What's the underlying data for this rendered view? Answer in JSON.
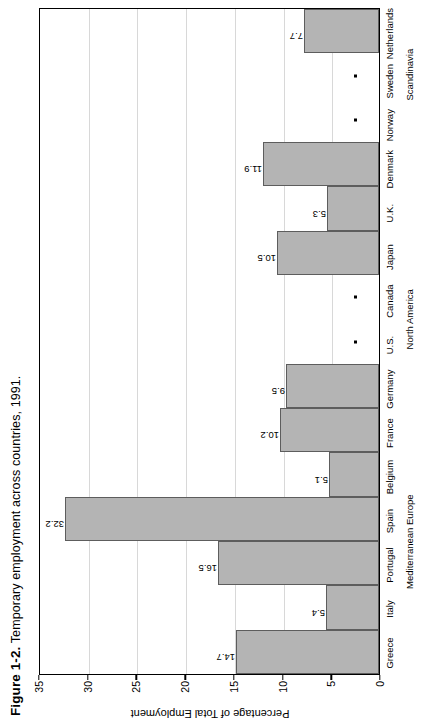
{
  "figure": {
    "number": "Figure 1-2.",
    "caption": "Temporary employment across countries, 1991."
  },
  "chart_data": {
    "type": "bar",
    "title": "Temporary employment across countries, 1991.",
    "xlabel": "",
    "ylabel": "Percentage of Total Employment",
    "ylim": [
      0,
      35
    ],
    "yticks": [
      "0",
      "5",
      "10",
      "15",
      "20",
      "25",
      "30",
      "35"
    ],
    "ytick_values": [
      0,
      5,
      10,
      15,
      20,
      25,
      30,
      35
    ],
    "grid": true,
    "orientation": "vertical",
    "bar_color": "#b4b4b4",
    "bar_border_color": "#5d5d5d",
    "missing_marker": "*",
    "categories": [
      "Greece",
      "Italy",
      "Portugal",
      "Spain",
      "Belgium",
      "France",
      "Germany",
      "U.S.",
      "Canada",
      "Japan",
      "U.K.",
      "Denmark",
      "Norway",
      "Sweden",
      "Netherlands"
    ],
    "values": [
      14.7,
      5.4,
      16.5,
      32.2,
      5.1,
      10.2,
      9.5,
      null,
      null,
      10.5,
      5.3,
      11.9,
      null,
      null,
      7.7
    ],
    "value_labels": [
      "14.7",
      "5.4",
      "16.5",
      "32.2",
      "5.1",
      "10.2",
      "9.5",
      "*",
      "*",
      "10.5",
      "5.3",
      "11.9",
      "*",
      "*",
      "7.7"
    ],
    "groups": [
      {
        "label": "Mediterranean Europe",
        "start": 0,
        "end": 5
      },
      {
        "label": "North America",
        "start": 7,
        "end": 8
      },
      {
        "label": "Scandinavia",
        "start": 12,
        "end": 14
      }
    ]
  }
}
